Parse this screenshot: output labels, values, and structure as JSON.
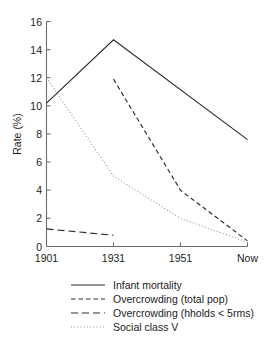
{
  "chart_data": {
    "type": "line",
    "title": "",
    "xlabel": "",
    "ylabel": "Rate (%)",
    "x": [
      "1901",
      "1931",
      "1951",
      "Now"
    ],
    "xtick_labels": [
      "1901",
      "1931",
      "1951",
      "Now"
    ],
    "ytick_labels": [
      "0",
      "2",
      "4",
      "6",
      "8",
      "10",
      "12",
      "14",
      "16"
    ],
    "ylim": [
      0,
      16
    ],
    "grid": false,
    "legend_position": "below-axes",
    "series": [
      {
        "name": "Infant mortality",
        "style": "solid",
        "color": "#2b2b2b",
        "x": [
          "1901",
          "1931",
          "Now"
        ],
        "values": [
          10.2,
          14.7,
          7.6
        ]
      },
      {
        "name": "Overcrowding (total pop)",
        "style": "short-dash",
        "color": "#2b2b2b",
        "x": [
          "1931",
          "1951",
          "Now"
        ],
        "values": [
          11.9,
          4.0,
          0.4
        ]
      },
      {
        "name": "Overcrowding (hholds < 5rms)",
        "style": "long-dash",
        "color": "#2b2b2b",
        "x": [
          "1901",
          "1931"
        ],
        "values": [
          1.25,
          0.8
        ]
      },
      {
        "name": "Social class V",
        "style": "dotted",
        "color": "#9a9a9a",
        "x": [
          "1901",
          "1931",
          "1951",
          "Now"
        ],
        "values": [
          12.0,
          5.0,
          2.0,
          0.3
        ]
      }
    ]
  },
  "axes": {
    "ylabel": "Rate (%)",
    "yticks": [
      {
        "label": "16"
      },
      {
        "label": "14"
      },
      {
        "label": "12"
      },
      {
        "label": "10"
      },
      {
        "label": "8"
      },
      {
        "label": "6"
      },
      {
        "label": "4"
      },
      {
        "label": "2"
      },
      {
        "label": "0"
      }
    ],
    "xticks": [
      {
        "label": "1901"
      },
      {
        "label": "1931"
      },
      {
        "label": "1951"
      },
      {
        "label": "Now"
      }
    ]
  },
  "legend": {
    "entries": [
      {
        "label": "Infant mortality",
        "style": "solid"
      },
      {
        "label": "Overcrowding (total pop)",
        "style": "short-dash"
      },
      {
        "label": "Overcrowding (hholds < 5rms)",
        "style": "long-dash"
      },
      {
        "label": "Social class V",
        "style": "dotted"
      }
    ]
  }
}
